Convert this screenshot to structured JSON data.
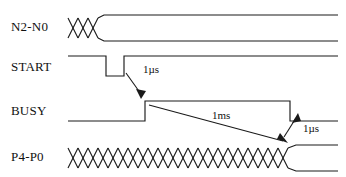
{
  "diagram": {
    "type": "timing-diagram",
    "title": "",
    "width": 346,
    "height": 177,
    "background_color": "#ffffff",
    "line_color": "#1a1a1a",
    "signals": [
      {
        "name": "N2-N0",
        "label": "N2-N0",
        "kind": "bus",
        "row_y": 28,
        "description": "Bus with three X transitions then stable valid data"
      },
      {
        "name": "START",
        "label": "START",
        "kind": "logic",
        "row_y": 68,
        "description": "Active-high idle with a short low-going pulse"
      },
      {
        "name": "BUSY",
        "label": "BUSY",
        "kind": "logic",
        "row_y": 112,
        "description": "Low idle, rises after START pulse, stays high for 1ms, then falls"
      },
      {
        "name": "P4-P0",
        "label": "P4-P0",
        "kind": "bus",
        "row_y": 158,
        "description": "Bus toggling continuously, settles to stable data when BUSY falls"
      }
    ],
    "annotations": [
      {
        "name": "start-to-busy-delay",
        "label": "1µs",
        "text_x": 143,
        "text_y": 70,
        "from": "START falling edge",
        "to": "BUSY rising edge",
        "arrow": "down-right"
      },
      {
        "name": "busy-duration",
        "label": "1ms",
        "text_x": 212,
        "text_y": 116,
        "from": "BUSY rising edge",
        "to": "P4-P0 settle point",
        "arrow": "down-right"
      },
      {
        "name": "busy-fall-to-data-valid",
        "label": "1µs",
        "text_x": 303,
        "text_y": 129,
        "from": "P4-P0 settle point",
        "to": "BUSY falling edge",
        "arrow": "up-right"
      }
    ],
    "colors": {
      "stroke": "#1a1a1a",
      "text": "#111111",
      "background": "#ffffff"
    }
  }
}
